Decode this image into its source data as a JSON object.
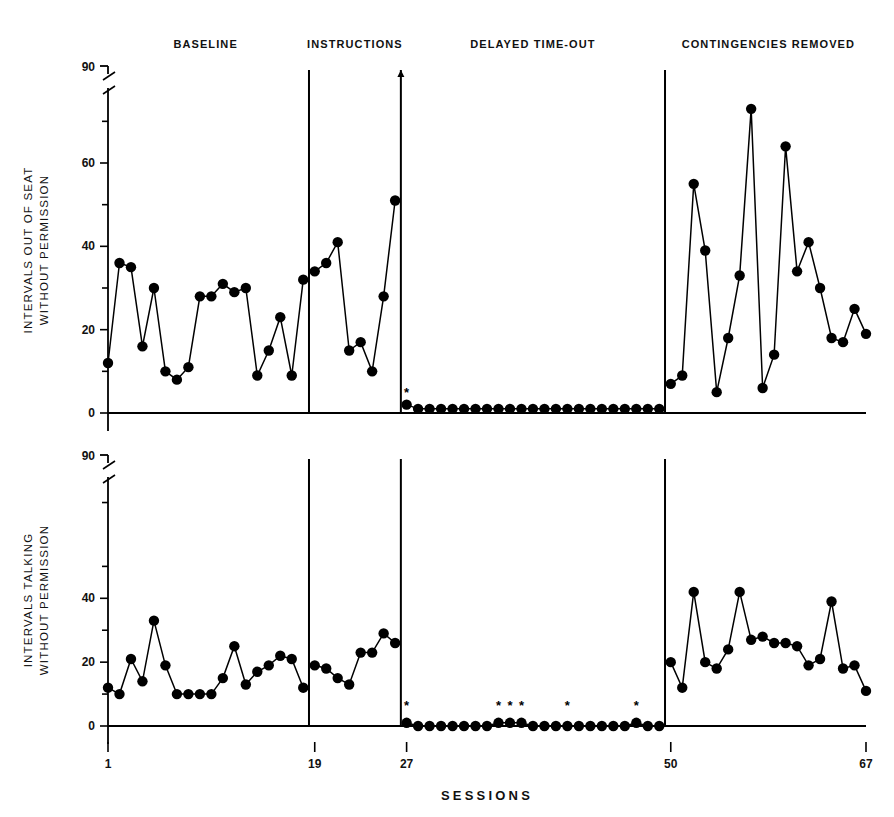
{
  "figure": {
    "x_axis_title": "SESSIONS",
    "x_ticks": [
      "1",
      "19",
      "27",
      "50",
      "67"
    ],
    "phase_labels": [
      "BASELINE",
      "INSTRUCTIONS",
      "DELAYED TIME-OUT",
      "CONTINGENCIES REMOVED"
    ],
    "asterisk_glyph": "*"
  },
  "panel_top": {
    "ylabel_line1": "INTERVALS OUT OF SEAT",
    "ylabel_line2": "WITHOUT PERMISSION",
    "y_ticks": [
      "0",
      "20",
      "40",
      "60",
      "90"
    ]
  },
  "panel_bottom": {
    "ylabel_line1": "INTERVALS TALKING",
    "ylabel_line2": "WITHOUT PERMISSION",
    "y_ticks": [
      "0",
      "20",
      "40",
      "90"
    ]
  },
  "chart_data": [
    {
      "type": "line",
      "title": "INTERVALS OUT OF SEAT WITHOUT PERMISSION",
      "xlabel": "SESSIONS",
      "ylabel": "INTERVALS OUT OF SEAT WITHOUT PERMISSION",
      "xlim": [
        1,
        67
      ],
      "ylim": [
        0,
        90
      ],
      "y_axis_break": {
        "from": 78,
        "to": 90
      },
      "y_tick_values": [
        0,
        20,
        40,
        60,
        90
      ],
      "y_minor_tick_values": [
        10,
        30,
        50,
        70,
        78
      ],
      "x_tick_values": [
        1,
        19,
        27,
        50,
        67
      ],
      "grid": false,
      "legend": "none",
      "marker": "filled-circle",
      "phases": [
        {
          "name": "BASELINE",
          "x_start": 1,
          "x_end": 18,
          "x": [
            1,
            2,
            3,
            4,
            5,
            6,
            7,
            8,
            9,
            10,
            11,
            12,
            13,
            14,
            15,
            16,
            17,
            18
          ],
          "values": [
            12,
            36,
            35,
            16,
            30,
            10,
            8,
            11,
            28,
            28,
            31,
            29,
            30,
            9,
            15,
            23,
            9,
            32
          ]
        },
        {
          "name": "INSTRUCTIONS",
          "x_start": 19,
          "x_end": 26,
          "x": [
            19,
            20,
            21,
            22,
            23,
            24,
            25,
            26
          ],
          "values": [
            34,
            36,
            41,
            15,
            17,
            10,
            28,
            51
          ]
        },
        {
          "name": "DELAYED TIME-OUT",
          "x_start": 27,
          "x_end": 49,
          "x": [
            27,
            28,
            29,
            30,
            31,
            32,
            33,
            34,
            35,
            36,
            37,
            38,
            39,
            40,
            41,
            42,
            43,
            44,
            45,
            46,
            47,
            48,
            49
          ],
          "values": [
            2,
            1,
            1,
            1,
            1,
            1,
            1,
            1,
            1,
            1,
            1,
            1,
            1,
            1,
            1,
            1,
            1,
            1,
            1,
            1,
            1,
            1,
            1
          ],
          "asterisk_x": [
            27
          ]
        },
        {
          "name": "CONTINGENCIES REMOVED",
          "x_start": 50,
          "x_end": 67,
          "x": [
            50,
            51,
            52,
            53,
            54,
            55,
            56,
            57,
            58,
            59,
            60,
            61,
            62,
            63,
            64,
            65,
            66,
            67
          ],
          "values": [
            7,
            9,
            55,
            39,
            5,
            18,
            33,
            73,
            6,
            14,
            64,
            34,
            41,
            30,
            18,
            17,
            25,
            19
          ]
        }
      ]
    },
    {
      "type": "line",
      "title": "INTERVALS TALKING WITHOUT PERMISSION",
      "xlabel": "SESSIONS",
      "ylabel": "INTERVALS TALKING WITHOUT PERMISSION",
      "xlim": [
        1,
        67
      ],
      "ylim": [
        0,
        90
      ],
      "y_axis_break": {
        "from": 78,
        "to": 90
      },
      "y_tick_values": [
        0,
        20,
        40,
        90
      ],
      "y_minor_tick_values": [
        10,
        30,
        50,
        70,
        78
      ],
      "x_tick_values": [
        1,
        19,
        27,
        50,
        67
      ],
      "grid": false,
      "legend": "none",
      "marker": "filled-circle",
      "phases": [
        {
          "name": "BASELINE",
          "x_start": 1,
          "x_end": 18,
          "x": [
            1,
            2,
            3,
            4,
            5,
            6,
            7,
            8,
            9,
            10,
            11,
            12,
            13,
            14,
            15,
            16,
            17,
            18
          ],
          "values": [
            12,
            10,
            21,
            14,
            33,
            19,
            10,
            10,
            10,
            10,
            15,
            25,
            13,
            17,
            19,
            22,
            21,
            12
          ]
        },
        {
          "name": "INSTRUCTIONS",
          "x_start": 19,
          "x_end": 26,
          "x": [
            19,
            20,
            21,
            22,
            23,
            24,
            25,
            26
          ],
          "values": [
            19,
            18,
            15,
            13,
            23,
            23,
            29,
            26
          ]
        },
        {
          "name": "DELAYED TIME-OUT",
          "x_start": 27,
          "x_end": 49,
          "x": [
            27,
            28,
            29,
            30,
            31,
            32,
            33,
            34,
            35,
            36,
            37,
            38,
            39,
            40,
            41,
            42,
            43,
            44,
            45,
            46,
            47,
            48,
            49
          ],
          "values": [
            1,
            0,
            0,
            0,
            0,
            0,
            0,
            0,
            1,
            1,
            1,
            0,
            0,
            0,
            0,
            0,
            0,
            0,
            0,
            0,
            1,
            0,
            0
          ],
          "asterisk_x": [
            27,
            35,
            36,
            37,
            41,
            47
          ]
        },
        {
          "name": "CONTINGENCIES REMOVED",
          "x_start": 50,
          "x_end": 67,
          "x": [
            50,
            51,
            52,
            53,
            54,
            55,
            56,
            57,
            58,
            59,
            60,
            61,
            62,
            63,
            64,
            65,
            66,
            67
          ],
          "values": [
            20,
            12,
            42,
            20,
            18,
            24,
            42,
            27,
            28,
            26,
            26,
            25,
            19,
            21,
            39,
            18,
            19,
            11
          ]
        }
      ]
    }
  ]
}
